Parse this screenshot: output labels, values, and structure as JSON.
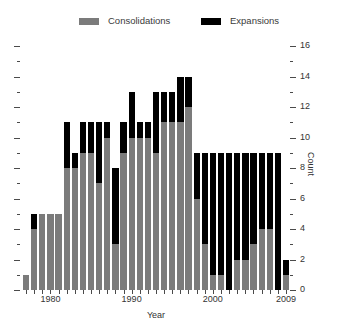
{
  "chart_data": {
    "type": "bar",
    "subtype": "stacked-bar",
    "title": "",
    "xlabel": "Year",
    "ylabel": "Count",
    "ylim": [
      0,
      16
    ],
    "y_major_ticks": [
      0,
      2,
      4,
      6,
      8,
      10,
      12,
      14,
      16
    ],
    "y_minor_ticks": [
      1,
      3,
      5,
      7,
      9,
      11,
      13,
      15
    ],
    "y_tick_labels": [
      "0",
      "2",
      "4",
      "6",
      "8",
      "10",
      "12",
      "14",
      "16"
    ],
    "grid": false,
    "legend_position": "top",
    "x_tick_labels": [
      "1980",
      "1990",
      "2000",
      "2009"
    ],
    "x_tick_years": [
      1980,
      1990,
      2000,
      2009
    ],
    "categories": [
      1977,
      1978,
      1979,
      1980,
      1981,
      1982,
      1983,
      1984,
      1985,
      1986,
      1987,
      1988,
      1989,
      1990,
      1991,
      1992,
      1993,
      1994,
      1995,
      1996,
      1997,
      1998,
      1999,
      2000,
      2001,
      2002,
      2003,
      2004,
      2005,
      2006,
      2007,
      2008,
      2009
    ],
    "series": [
      {
        "name": "Consolidations",
        "color": "#7b7b7b",
        "values": [
          1,
          4,
          5,
          5,
          5,
          8,
          8,
          9,
          9,
          7,
          10,
          3,
          9,
          10,
          10,
          10,
          9,
          11,
          11,
          11,
          12,
          6,
          3,
          1,
          1,
          0,
          2,
          2,
          3,
          4,
          4,
          0,
          1
        ]
      },
      {
        "name": "Expansions",
        "color": "#000000",
        "values": [
          0,
          1,
          0,
          0,
          0,
          3,
          1,
          2,
          2,
          4,
          1,
          5,
          2,
          3,
          1,
          1,
          4,
          2,
          2,
          3,
          2,
          3,
          6,
          8,
          8,
          9,
          7,
          7,
          6,
          5,
          5,
          9,
          1
        ]
      }
    ],
    "totals": [
      1,
      5,
      5,
      5,
      5,
      11,
      9,
      11,
      11,
      11,
      11,
      8,
      11,
      13,
      11,
      11,
      13,
      13,
      13,
      14,
      14,
      9,
      9,
      9,
      9,
      9,
      9,
      9,
      9,
      9,
      9,
      9,
      2
    ]
  },
  "legend": {
    "entries": [
      {
        "label": "Consolidations",
        "color": "#7b7b7b"
      },
      {
        "label": "Expansions",
        "color": "#000000"
      }
    ]
  },
  "axes": {
    "x_label": "Year",
    "y_label": "Count"
  }
}
